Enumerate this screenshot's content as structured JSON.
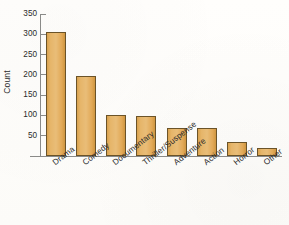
{
  "chart_data": {
    "type": "bar",
    "title": "",
    "xlabel": "",
    "ylabel": "Count",
    "categories": [
      "Drama",
      "Comedy",
      "Documentary",
      "Thriller/Suspense",
      "Adventure",
      "Action",
      "Horror",
      "Other"
    ],
    "values": [
      305,
      197,
      100,
      99,
      68,
      68,
      35,
      20
    ],
    "ylim": [
      0,
      350
    ],
    "yticks": [
      50,
      100,
      150,
      200,
      250,
      300,
      350
    ],
    "ytick_labels": [
      "50",
      "100",
      "150",
      "200",
      "250",
      "300",
      "350"
    ],
    "grid": false,
    "legend": null,
    "bar_color": "#e2a957",
    "bar_edge_color": "#6b5328",
    "axis_color": "#8a8a88",
    "background_color": "#fdfcfa"
  }
}
